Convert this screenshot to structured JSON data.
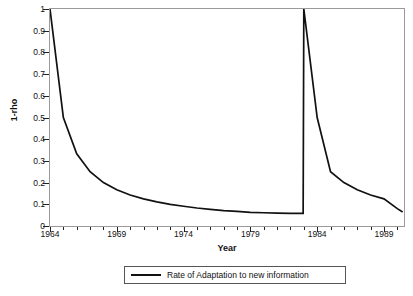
{
  "chart_data": {
    "type": "line",
    "title": "",
    "xlabel": "Year",
    "ylabel": "1-rho",
    "xlim": [
      1964,
      1990.5
    ],
    "ylim": [
      0,
      1
    ],
    "grid": false,
    "legend_position": "bottom",
    "y_ticks": [
      "0",
      "0.1",
      "0.2",
      "0.3",
      "0.4",
      "0.5",
      "0.6",
      "0.7",
      "0.8",
      "0.9",
      "1"
    ],
    "y_tick_values": [
      0,
      0.1,
      0.2,
      0.3,
      0.4,
      0.5,
      0.6,
      0.7,
      0.8,
      0.9,
      1
    ],
    "x_ticks": [
      "1964",
      "1969",
      "1974",
      "1979",
      "1984",
      "1989"
    ],
    "x_tick_values": [
      1964,
      1969,
      1974,
      1979,
      1984,
      1989
    ],
    "x_minor_step": 1,
    "series": [
      {
        "name": "Rate of Adaptation to new information",
        "color": "#111111",
        "x": [
          1964,
          1965,
          1966,
          1967,
          1968,
          1969,
          1970,
          1971,
          1972,
          1973,
          1974,
          1975,
          1976,
          1977,
          1978,
          1979,
          1980,
          1981,
          1982,
          1982.95,
          1983,
          1984,
          1985,
          1986,
          1987,
          1988,
          1989,
          1990,
          1990.4
        ],
        "values": [
          1.0,
          0.5,
          0.333,
          0.25,
          0.2,
          0.167,
          0.143,
          0.125,
          0.111,
          0.1,
          0.091,
          0.083,
          0.077,
          0.071,
          0.067,
          0.063,
          0.061,
          0.059,
          0.058,
          0.058,
          1.0,
          0.5,
          0.25,
          0.2,
          0.167,
          0.143,
          0.125,
          0.08,
          0.065
        ]
      }
    ],
    "legend": [
      {
        "label": "Rate of Adaptation to new information",
        "color": "#111111"
      }
    ],
    "annotations": [
      {
        "text": "spike reset to 1.0 at 1983"
      }
    ]
  }
}
